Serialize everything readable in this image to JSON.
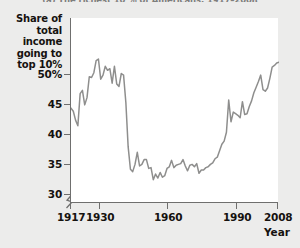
{
  "caption": "(a) The richest 10 % of Americans, 1917–2008",
  "axis": {
    "y_title_lines": [
      "Share of",
      "total income",
      "going to",
      "top 10%"
    ],
    "y_ticks": [
      "50%",
      "45",
      "40",
      "35",
      "30"
    ],
    "x_ticks": [
      "1917",
      "1930",
      "1960",
      "1990",
      "2008"
    ],
    "x_title": "Year",
    "break_symbol": "axis-break"
  },
  "colors": {
    "line": "#8e8e8d",
    "axis": "#6f6f6e",
    "plot_background": "#ffffff",
    "page_background": "#ececeb",
    "text": "#15120f"
  },
  "chart_data": {
    "type": "line",
    "title": "(a) The richest 10 % of Americans, 1917–2008",
    "xlabel": "Year",
    "ylabel": "Share of total income going to top 10%",
    "xlim": [
      1917,
      2008
    ],
    "ylim": [
      28.5,
      51.5
    ],
    "yticks": [
      30,
      35,
      40,
      45,
      50
    ],
    "xticks": [
      1917,
      1930,
      1960,
      1990,
      2008
    ],
    "grid": false,
    "legend": null,
    "y_axis_break": true,
    "series": [
      {
        "name": "Top 10% income share",
        "units": "percent",
        "x": [
          1917,
          1918,
          1919,
          1920,
          1921,
          1922,
          1923,
          1924,
          1925,
          1926,
          1927,
          1928,
          1929,
          1930,
          1931,
          1932,
          1933,
          1934,
          1935,
          1936,
          1937,
          1938,
          1939,
          1940,
          1941,
          1942,
          1943,
          1944,
          1945,
          1946,
          1947,
          1948,
          1949,
          1950,
          1951,
          1952,
          1953,
          1954,
          1955,
          1956,
          1957,
          1958,
          1959,
          1960,
          1961,
          1962,
          1963,
          1964,
          1965,
          1966,
          1967,
          1968,
          1969,
          1970,
          1971,
          1972,
          1973,
          1974,
          1975,
          1976,
          1977,
          1978,
          1979,
          1980,
          1981,
          1982,
          1983,
          1984,
          1985,
          1986,
          1987,
          1988,
          1989,
          1990,
          1991,
          1992,
          1993,
          1994,
          1995,
          1996,
          1997,
          1998,
          1999,
          2000,
          2001,
          2002,
          2003,
          2004,
          2005,
          2006,
          2007,
          2008
        ],
        "values": [
          40.3,
          39.9,
          38.8,
          38.1,
          42.1,
          42.5,
          40.7,
          41.6,
          44.2,
          44.1,
          44.7,
          46.2,
          46.4,
          43.9,
          44.4,
          45.5,
          45.0,
          45.2,
          43.4,
          45.5,
          43.3,
          43.0,
          44.6,
          44.4,
          41.0,
          35.5,
          32.7,
          32.4,
          33.3,
          34.8,
          33.1,
          33.3,
          33.9,
          33.9,
          32.8,
          32.9,
          31.4,
          32.1,
          31.6,
          32.3,
          31.7,
          31.9,
          32.8,
          33.0,
          33.8,
          32.9,
          33.2,
          33.3,
          33.4,
          33.9,
          33.1,
          32.5,
          33.2,
          33.3,
          33.0,
          33.4,
          32.2,
          32.6,
          32.6,
          32.9,
          33.0,
          33.3,
          33.5,
          34.0,
          34.2,
          35.0,
          35.8,
          36.2,
          37.3,
          41.3,
          38.6,
          39.8,
          39.6,
          39.4,
          39.1,
          41.1,
          39.5,
          39.6,
          40.5,
          41.2,
          42.2,
          42.9,
          43.6,
          44.4,
          42.6,
          42.4,
          42.8,
          44.0,
          45.4,
          45.6,
          45.9,
          46.0
        ],
        "key_points": {
          "1917_start": 40.3,
          "1928_peak": 46.2,
          "1929_peak": 46.4,
          "1942_45_collapse": 32.4,
          "1953_trough": 31.4,
          "1976_trough": 32.9,
          "1986_spike": 41.3,
          "2000_peak": 44.4,
          "2007_peak": 45.9,
          "2008_end": 46.0
        }
      }
    ]
  }
}
